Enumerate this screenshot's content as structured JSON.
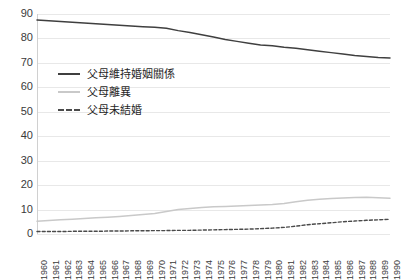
{
  "chart_data": {
    "type": "line",
    "title": "",
    "xlabel": "",
    "ylabel": "",
    "ylim": [
      0,
      90
    ],
    "ytick_step": 10,
    "grid": true,
    "legend_position": "inside-upper-left",
    "x": [
      1960,
      1961,
      1962,
      1963,
      1964,
      1965,
      1966,
      1967,
      1968,
      1969,
      1970,
      1971,
      1972,
      1973,
      1974,
      1975,
      1976,
      1977,
      1978,
      1979,
      1980,
      1981,
      1982,
      1983,
      1984,
      1985,
      1986,
      1987,
      1988,
      1989,
      1990
    ],
    "categories": [
      "1960",
      "1961",
      "1962",
      "1963",
      "1964",
      "1965",
      "1966",
      "1967",
      "1968",
      "1969",
      "1970",
      "1971",
      "1972",
      "1973",
      "1974",
      "1975",
      "1976",
      "1977",
      "1978",
      "1979",
      "1980",
      "1981",
      "1982",
      "1983",
      "1984",
      "1985",
      "1986",
      "1987",
      "1988",
      "1989",
      "1990"
    ],
    "yticks": [
      0,
      10,
      20,
      30,
      40,
      50,
      60,
      70,
      80,
      90
    ],
    "ytick_labels": [
      "0",
      "10",
      "20",
      "30",
      "40",
      "50",
      "60",
      "70",
      "80",
      "90"
    ],
    "series": [
      {
        "name": "父母維持婚姻關係",
        "style": "solid",
        "color": "#3f3f3f",
        "values": [
          87.5,
          87.2,
          86.9,
          86.6,
          86.3,
          86.0,
          85.7,
          85.4,
          85.1,
          84.8,
          84.6,
          84.2,
          83.2,
          82.4,
          81.5,
          80.6,
          79.6,
          78.8,
          78.0,
          77.3,
          77.0,
          76.4,
          76.0,
          75.4,
          74.8,
          74.2,
          73.6,
          73.0,
          72.6,
          72.2,
          72.0
        ]
      },
      {
        "name": "父母離異",
        "style": "solid",
        "color": "#c9c9c9",
        "values": [
          5.2,
          5.5,
          5.8,
          6.0,
          6.3,
          6.6,
          6.9,
          7.2,
          7.6,
          8.0,
          8.4,
          9.2,
          10.0,
          10.4,
          10.8,
          11.1,
          11.3,
          11.5,
          11.7,
          11.9,
          12.1,
          12.5,
          13.2,
          13.8,
          14.2,
          14.5,
          14.7,
          14.9,
          15.0,
          14.8,
          14.6
        ]
      },
      {
        "name": "父母未結婚",
        "style": "dashed",
        "color": "#4a4a4a",
        "values": [
          1.0,
          1.0,
          1.0,
          1.1,
          1.1,
          1.1,
          1.2,
          1.2,
          1.3,
          1.3,
          1.4,
          1.4,
          1.5,
          1.5,
          1.6,
          1.7,
          1.8,
          1.9,
          2.0,
          2.2,
          2.4,
          2.7,
          3.2,
          3.8,
          4.2,
          4.6,
          5.0,
          5.3,
          5.6,
          5.8,
          6.0
        ]
      }
    ]
  },
  "legend": {
    "items": [
      {
        "label": "父母維持婚姻關係"
      },
      {
        "label": "父母離異"
      },
      {
        "label": "父母未結婚"
      }
    ]
  },
  "colors": {
    "gridline": "#e8e8e8",
    "axis": "#d0d0d0",
    "text": "#3a3a3a",
    "background": "#ffffff"
  }
}
